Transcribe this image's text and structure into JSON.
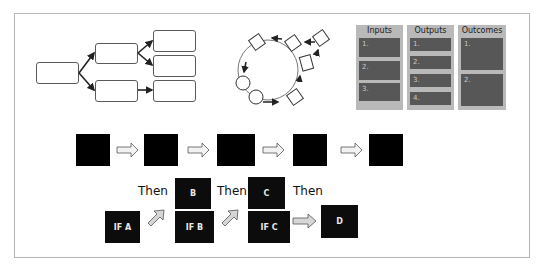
{
  "tree_diagram": {
    "boxes": [
      {
        "id": "root",
        "x": 36,
        "y": 62,
        "w": 43,
        "h": 22
      },
      {
        "id": "mid-1",
        "x": 95,
        "y": 43,
        "w": 43,
        "h": 21
      },
      {
        "id": "mid-2",
        "x": 95,
        "y": 80,
        "w": 43,
        "h": 22
      },
      {
        "id": "leaf-1",
        "x": 153,
        "y": 30,
        "w": 43,
        "h": 22
      },
      {
        "id": "leaf-2",
        "x": 153,
        "y": 55,
        "w": 43,
        "h": 22
      },
      {
        "id": "leaf-3",
        "x": 153,
        "y": 80,
        "w": 43,
        "h": 22
      }
    ]
  },
  "cycle_diagram": {
    "center": [
      266,
      67
    ],
    "radius": 30,
    "circle_nodes": 2,
    "square_nodes": 5
  },
  "logic_model": {
    "columns": [
      {
        "title": "Inputs",
        "items": [
          "1.",
          "2.",
          "3."
        ]
      },
      {
        "title": "Outputs",
        "items": [
          "1.",
          "2.",
          "3.",
          "4."
        ]
      },
      {
        "title": "Outcomes",
        "items": [
          "1.",
          "2."
        ]
      }
    ],
    "colors": {
      "panel": "#b9b9b9",
      "cell": "#575757"
    }
  },
  "sequence_row": {
    "step_count": 5,
    "arrow_glyph": "right-outline-arrow"
  },
  "if_then_chain": {
    "conditions": [
      "IF A",
      "IF B",
      "IF C"
    ],
    "results": [
      "B",
      "C",
      "D"
    ],
    "connector_label": "Then",
    "then_labels": [
      "Then",
      "Then",
      "Then"
    ]
  }
}
